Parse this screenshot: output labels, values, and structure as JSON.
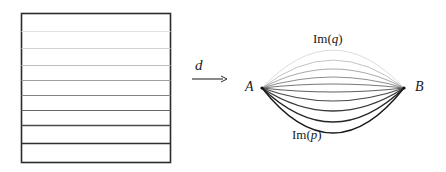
{
  "figure": {
    "name": "foliation-to-lens-diagram",
    "background_color": "#ffffff",
    "width": 446,
    "height": 172
  },
  "left_panel": {
    "name": "foliated-rectangle",
    "description": "rectangle subdivided by horizontal leaf lines",
    "rect": {
      "x": 21,
      "y": 13,
      "width": 149,
      "height": 149
    },
    "border_color": "#2b2b2b",
    "border_width": 1.6,
    "leaf_lines": [
      {
        "y": 31,
        "color": "#e2e2e2",
        "width": 1.0
      },
      {
        "y": 48,
        "color": "#d2d2d2",
        "width": 1.0
      },
      {
        "y": 65,
        "color": "#bdbdbd",
        "width": 1.1
      },
      {
        "y": 80,
        "color": "#9e9e9e",
        "width": 1.1
      },
      {
        "y": 95,
        "color": "#838383",
        "width": 1.2
      },
      {
        "y": 110,
        "color": "#666666",
        "width": 1.2
      },
      {
        "y": 125,
        "color": "#4a4a4a",
        "width": 1.3
      },
      {
        "y": 143,
        "color": "#2f2f2f",
        "width": 1.4
      }
    ]
  },
  "map_arrow": {
    "name": "map-arrow-d",
    "label": "d",
    "x1": 192,
    "y1": 79,
    "x2": 227,
    "y2": 79,
    "color": "#2b2b2b"
  },
  "right_panel": {
    "name": "lens-curve-family",
    "point_A": {
      "label": "A",
      "x": 262,
      "y": 88
    },
    "point_B": {
      "label": "B",
      "x": 404,
      "y": 88
    },
    "top_label": "Im(q)",
    "top_label_roman": "Im(",
    "top_label_italic": "q",
    "top_label_close": ")",
    "bottom_label": "Im(p)",
    "bottom_label_roman": "Im(",
    "bottom_label_italic": "p",
    "bottom_label_close": ")",
    "curves": [
      {
        "sag": -38,
        "color": "#dcdcdc",
        "width": 1.0
      },
      {
        "sag": -28,
        "color": "#c4c4c4",
        "width": 1.0
      },
      {
        "sag": -19,
        "color": "#ababab",
        "width": 1.05
      },
      {
        "sag": -11,
        "color": "#8f8f8f",
        "width": 1.1
      },
      {
        "sag": -4,
        "color": "#777777",
        "width": 1.1
      },
      {
        "sag": 4,
        "color": "#5f5f5f",
        "width": 1.15
      },
      {
        "sag": 13,
        "color": "#4a4a4a",
        "width": 1.2
      },
      {
        "sag": 23,
        "color": "#383838",
        "width": 1.25
      },
      {
        "sag": 34,
        "color": "#262626",
        "width": 1.3
      },
      {
        "sag": 45,
        "color": "#1a1a1a",
        "width": 1.35
      }
    ]
  }
}
